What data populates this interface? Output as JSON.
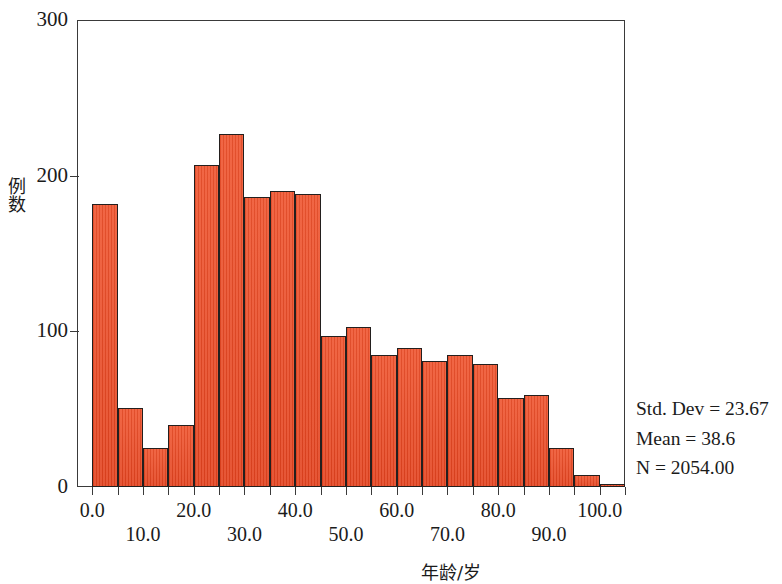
{
  "chart_data": {
    "type": "bar",
    "title": "",
    "subtitle": "",
    "xlabel": "年龄/岁",
    "ylabel": "例数",
    "xlim": [
      -3,
      105
    ],
    "ylim": [
      0,
      300
    ],
    "grid": false,
    "legend": "none",
    "bin_width": 5,
    "x_tick_labels_row_a": [
      "0.0",
      "20.0",
      "40.0",
      "60.0",
      "80.0",
      "100.0"
    ],
    "x_tick_values_row_a": [
      0,
      20,
      40,
      60,
      80,
      100
    ],
    "x_tick_labels_row_b": [
      "10.0",
      "30.0",
      "50.0",
      "70.0",
      "90.0"
    ],
    "x_tick_values_row_b": [
      10,
      30,
      50,
      70,
      90
    ],
    "y_tick_labels": [
      "0",
      "100",
      "200",
      "300"
    ],
    "y_tick_values": [
      0,
      100,
      200,
      300
    ],
    "categories": [
      "0-5",
      "5-10",
      "10-15",
      "15-20",
      "20-25",
      "25-30",
      "30-35",
      "35-40",
      "40-45",
      "45-50",
      "50-55",
      "55-60",
      "60-65",
      "65-70",
      "70-75",
      "75-80",
      "80-85",
      "85-90",
      "90-95",
      "95-100",
      "100-105"
    ],
    "bin_starts": [
      0,
      5,
      10,
      15,
      20,
      25,
      30,
      35,
      40,
      45,
      50,
      55,
      60,
      65,
      70,
      75,
      80,
      85,
      90,
      95,
      100
    ],
    "values": [
      182,
      51,
      25,
      40,
      207,
      227,
      186,
      190,
      188,
      97,
      103,
      85,
      89,
      81,
      85,
      79,
      57,
      59,
      25,
      8,
      2
    ],
    "annotations": [
      "Std. Dev = 23.67",
      "Mean = 38.6",
      "N = 2054.00"
    ],
    "bar_fill_color": "#e8482a",
    "bar_edge_color": "#231f1e",
    "axis_color": "#3a3a3a"
  },
  "stats": {
    "std_dev": "Std. Dev = 23.67",
    "mean": "Mean = 38.6",
    "n": "N = 2054.00"
  }
}
